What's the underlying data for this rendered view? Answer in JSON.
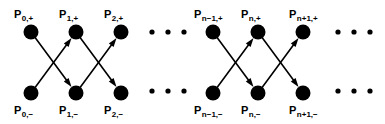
{
  "figure": {
    "width": 385,
    "height": 124,
    "background_color": "#ffffff",
    "ink_color": "#000000"
  },
  "geometry": {
    "node_radius": 7.5,
    "row_top_y": 32,
    "row_bottom_y": 93,
    "label_top_y": 18,
    "label_bottom_y": 114,
    "columns_x": [
      31,
      76,
      121,
      213,
      258,
      303
    ],
    "edge_stroke_width": 1.6,
    "arrow_head_length": 9,
    "arrow_head_width": 6,
    "ellipsis_dot_radius": 2.6
  },
  "nodes": [
    {
      "id": "P0+",
      "group": 1,
      "column": 0,
      "row": "top",
      "cx": 31,
      "cy": 32,
      "label_base": "P",
      "label_sub": "0,+",
      "label_x": 14,
      "label_y": 18
    },
    {
      "id": "P1+",
      "group": 1,
      "column": 1,
      "row": "top",
      "cx": 76,
      "cy": 32,
      "label_base": "P",
      "label_sub": "1,+",
      "label_x": 59,
      "label_y": 18
    },
    {
      "id": "P2+",
      "group": 1,
      "column": 2,
      "row": "top",
      "cx": 121,
      "cy": 32,
      "label_base": "P",
      "label_sub": "2,+",
      "label_x": 104,
      "label_y": 18
    },
    {
      "id": "P0-",
      "group": 1,
      "column": 0,
      "row": "bottom",
      "cx": 31,
      "cy": 93,
      "label_base": "P",
      "label_sub": "0,−",
      "label_x": 14,
      "label_y": 114
    },
    {
      "id": "P1-",
      "group": 1,
      "column": 1,
      "row": "bottom",
      "cx": 76,
      "cy": 93,
      "label_base": "P",
      "label_sub": "1,−",
      "label_x": 59,
      "label_y": 114
    },
    {
      "id": "P2-",
      "group": 1,
      "column": 2,
      "row": "bottom",
      "cx": 121,
      "cy": 93,
      "label_base": "P",
      "label_sub": "2,−",
      "label_x": 104,
      "label_y": 114
    },
    {
      "id": "Pn-1+",
      "group": 2,
      "column": 0,
      "row": "top",
      "cx": 213,
      "cy": 32,
      "label_base": "P",
      "label_sub": "n−1,+",
      "label_x": 194,
      "label_y": 18
    },
    {
      "id": "Pn+",
      "group": 2,
      "column": 1,
      "row": "top",
      "cx": 258,
      "cy": 32,
      "label_base": "P",
      "label_sub": "n,+",
      "label_x": 241,
      "label_y": 18
    },
    {
      "id": "Pn+1+",
      "group": 2,
      "column": 2,
      "row": "top",
      "cx": 303,
      "cy": 32,
      "label_base": "P",
      "label_sub": "n+1,+",
      "label_x": 289,
      "label_y": 18
    },
    {
      "id": "Pn-1-",
      "group": 2,
      "column": 0,
      "row": "bottom",
      "cx": 213,
      "cy": 93,
      "label_base": "P",
      "label_sub": "n−1,−",
      "label_x": 194,
      "label_y": 114
    },
    {
      "id": "Pn-",
      "group": 2,
      "column": 1,
      "row": "bottom",
      "cx": 258,
      "cy": 93,
      "label_base": "P",
      "label_sub": "n,−",
      "label_x": 241,
      "label_y": 114
    },
    {
      "id": "Pn+1-",
      "group": 2,
      "column": 2,
      "row": "bottom",
      "cx": 303,
      "cy": 93,
      "label_base": "P",
      "label_sub": "n+1,−",
      "label_x": 289,
      "label_y": 114
    }
  ],
  "edges": [
    {
      "id": "e1",
      "from": "P0+",
      "to": "P1-",
      "group": 1,
      "direction": "down-right",
      "arrow": true
    },
    {
      "id": "e2",
      "from": "P0-",
      "to": "P1+",
      "group": 1,
      "direction": "up-right",
      "arrow": true
    },
    {
      "id": "e3",
      "from": "P1+",
      "to": "P2-",
      "group": 1,
      "direction": "down-right",
      "arrow": true
    },
    {
      "id": "e4",
      "from": "P1-",
      "to": "P2+",
      "group": 1,
      "direction": "up-right",
      "arrow": true
    },
    {
      "id": "e5",
      "from": "Pn-1+",
      "to": "Pn-",
      "group": 2,
      "direction": "down-right",
      "arrow": true
    },
    {
      "id": "e6",
      "from": "Pn-1-",
      "to": "Pn+",
      "group": 2,
      "direction": "up-right",
      "arrow": true
    },
    {
      "id": "e7",
      "from": "Pn+",
      "to": "Pn+1-",
      "group": 2,
      "direction": "down-right",
      "arrow": true
    },
    {
      "id": "e8",
      "from": "Pn-",
      "to": "Pn+1+",
      "group": 2,
      "direction": "up-right",
      "arrow": true
    }
  ],
  "ellipses": [
    {
      "id": "mid-top",
      "row": "top",
      "cy": 32,
      "dots_x": [
        152,
        168,
        184
      ]
    },
    {
      "id": "mid-bottom",
      "row": "bottom",
      "cy": 91,
      "dots_x": [
        152,
        168,
        184
      ]
    },
    {
      "id": "right-top",
      "row": "top",
      "cy": 32,
      "dots_x": [
        338,
        354,
        370
      ]
    },
    {
      "id": "right-bottom",
      "row": "bottom",
      "cy": 91,
      "dots_x": [
        338,
        354,
        370
      ]
    }
  ]
}
